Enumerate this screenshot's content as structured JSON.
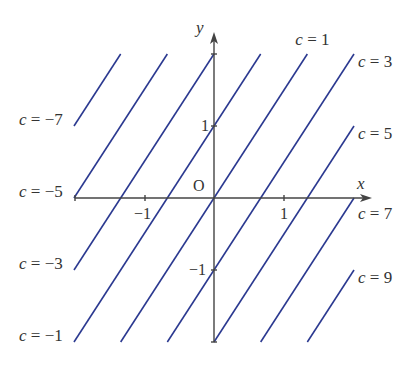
{
  "diagram": {
    "type": "level-lines",
    "equation": "c = 3x - 2y + 1",
    "axes": {
      "x_label": "x",
      "y_label": "y",
      "origin_label": "O",
      "x_ticks": [
        {
          "value": -1,
          "label": "−1"
        },
        {
          "value": 1,
          "label": "1"
        }
      ],
      "y_ticks": [
        {
          "value": 1,
          "label": "1"
        },
        {
          "value": -1,
          "label": "−1"
        }
      ],
      "x_range": [
        -2,
        2
      ],
      "y_range": [
        -2,
        2
      ]
    },
    "line_color": "#2b3990",
    "lines": [
      {
        "c": -7,
        "label": "c = −7",
        "side": "left"
      },
      {
        "c": -5,
        "label": "c = −5",
        "side": "left"
      },
      {
        "c": -3,
        "label": "c = −3",
        "side": "left"
      },
      {
        "c": -1,
        "label": "c = −1",
        "side": "left"
      },
      {
        "c": 1,
        "label": "c = 1",
        "side": "top"
      },
      {
        "c": 3,
        "label": "c = 3",
        "side": "right"
      },
      {
        "c": 5,
        "label": "c = 5",
        "side": "right"
      },
      {
        "c": 7,
        "label": "c = 7",
        "side": "right"
      },
      {
        "c": 9,
        "label": "c = 9",
        "side": "right"
      }
    ]
  }
}
